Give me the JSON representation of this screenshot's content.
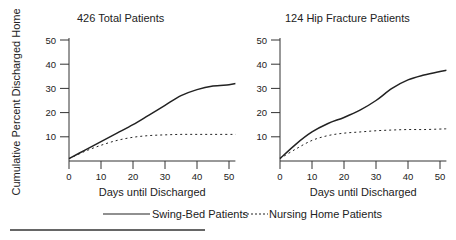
{
  "y_axis_label": "Cumulative Percent Discharged Home",
  "legend": {
    "solid_label": "Swing-Bed Patients",
    "dotted_label": "Nursing Home Patients"
  },
  "chart_data": [
    {
      "type": "line",
      "title": "426 Total Patients",
      "xlabel": "Days until Discharged",
      "ylabel": "Cumulative Percent Discharged Home",
      "x_ticks": [
        "0",
        "10",
        "20",
        "30",
        "40",
        "50"
      ],
      "y_ticks": [
        "10",
        "20",
        "30",
        "40",
        "50"
      ],
      "xlim": [
        0,
        52
      ],
      "ylim": [
        0,
        50
      ],
      "x": [
        0,
        5,
        10,
        15,
        20,
        25,
        30,
        35,
        40,
        45,
        50,
        52
      ],
      "series": [
        {
          "name": "Swing-Bed Patients",
          "style": "solid",
          "values": [
            1,
            4.5,
            8,
            11.5,
            15,
            19,
            23,
            27,
            29.5,
            31,
            31.5,
            32
          ]
        },
        {
          "name": "Nursing Home Patients",
          "style": "dotted",
          "values": [
            1,
            4,
            6.5,
            8.5,
            9.8,
            10.5,
            10.8,
            11,
            11,
            11,
            11,
            11
          ]
        }
      ],
      "grid": false,
      "legend_position": "bottom"
    },
    {
      "type": "line",
      "title": "124 Hip Fracture Patients",
      "xlabel": "Days until Discharged",
      "ylabel": "Cumulative Percent Discharged Home",
      "x_ticks": [
        "0",
        "10",
        "20",
        "30",
        "40",
        "50"
      ],
      "y_ticks": [
        "10",
        "20",
        "30",
        "40",
        "50"
      ],
      "xlim": [
        0,
        52
      ],
      "ylim": [
        0,
        50
      ],
      "x": [
        0,
        5,
        10,
        15,
        20,
        25,
        30,
        35,
        40,
        45,
        50,
        52
      ],
      "series": [
        {
          "name": "Swing-Bed Patients",
          "style": "solid",
          "values": [
            1,
            7,
            12,
            15.5,
            18,
            21,
            25,
            30,
            33.5,
            35.5,
            37,
            37.5
          ]
        },
        {
          "name": "Nursing Home Patients",
          "style": "dotted",
          "values": [
            1,
            5,
            8.5,
            10.5,
            11.5,
            12,
            12.5,
            12.8,
            13,
            13,
            13.2,
            13.3
          ]
        }
      ],
      "grid": false,
      "legend_position": "bottom"
    }
  ]
}
